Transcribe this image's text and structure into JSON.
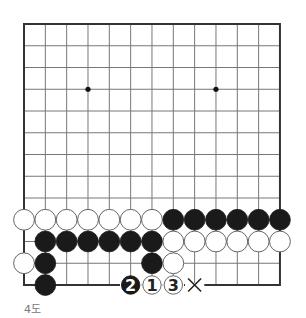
{
  "diagram": {
    "type": "go-board-partial",
    "columns": 13,
    "rows": 13,
    "origin": {
      "x": 24,
      "y": 24
    },
    "spacing": {
      "x": 21.33,
      "y": 21.75
    },
    "star_points": [
      [
        3,
        3
      ],
      [
        9,
        3
      ]
    ],
    "colors": {
      "grid_line": "#777777",
      "border": "#333333",
      "black_stone": "#1a1a1a",
      "white_stone_fill": "#ffffff",
      "white_stone_stroke": "#555555",
      "star": "#111111"
    },
    "stones": [
      {
        "c": 0,
        "r": 9,
        "color": "white"
      },
      {
        "c": 1,
        "r": 9,
        "color": "white"
      },
      {
        "c": 2,
        "r": 9,
        "color": "white"
      },
      {
        "c": 3,
        "r": 9,
        "color": "white"
      },
      {
        "c": 4,
        "r": 9,
        "color": "white"
      },
      {
        "c": 5,
        "r": 9,
        "color": "white"
      },
      {
        "c": 6,
        "r": 9,
        "color": "white"
      },
      {
        "c": 7,
        "r": 9,
        "color": "black"
      },
      {
        "c": 8,
        "r": 9,
        "color": "black"
      },
      {
        "c": 9,
        "r": 9,
        "color": "black"
      },
      {
        "c": 10,
        "r": 9,
        "color": "black"
      },
      {
        "c": 11,
        "r": 9,
        "color": "black"
      },
      {
        "c": 12,
        "r": 9,
        "color": "black"
      },
      {
        "c": 1,
        "r": 10,
        "color": "black"
      },
      {
        "c": 2,
        "r": 10,
        "color": "black"
      },
      {
        "c": 3,
        "r": 10,
        "color": "black"
      },
      {
        "c": 4,
        "r": 10,
        "color": "black"
      },
      {
        "c": 5,
        "r": 10,
        "color": "black"
      },
      {
        "c": 6,
        "r": 10,
        "color": "black"
      },
      {
        "c": 7,
        "r": 10,
        "color": "white"
      },
      {
        "c": 8,
        "r": 10,
        "color": "white"
      },
      {
        "c": 9,
        "r": 10,
        "color": "white"
      },
      {
        "c": 10,
        "r": 10,
        "color": "white"
      },
      {
        "c": 11,
        "r": 10,
        "color": "white"
      },
      {
        "c": 12,
        "r": 10,
        "color": "white"
      },
      {
        "c": 0,
        "r": 11,
        "color": "white"
      },
      {
        "c": 1,
        "r": 11,
        "color": "black"
      },
      {
        "c": 6,
        "r": 11,
        "color": "black"
      },
      {
        "c": 7,
        "r": 11,
        "color": "white"
      },
      {
        "c": 1,
        "r": 12,
        "color": "black"
      }
    ],
    "numbered_moves": [
      {
        "c": 6,
        "r": 12,
        "color": "white",
        "label": "1"
      },
      {
        "c": 5,
        "r": 12,
        "color": "black",
        "label": "2"
      },
      {
        "c": 7,
        "r": 12,
        "color": "white",
        "label": "3"
      }
    ],
    "markers": [
      {
        "c": 8,
        "r": 12,
        "symbol": "×",
        "meaning": "x-mark"
      }
    ]
  },
  "caption": "4도"
}
